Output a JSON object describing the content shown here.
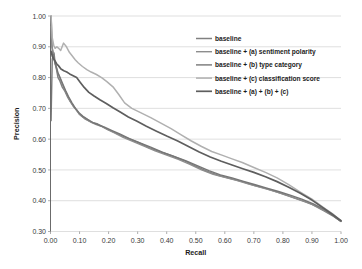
{
  "chart_data": {
    "type": "line",
    "title": "",
    "xlabel": "Recall",
    "ylabel": "Precision",
    "xlim": [
      0.0,
      1.0
    ],
    "ylim": [
      0.3,
      1.0
    ],
    "xticks": [
      "0.00",
      "0.10",
      "0.20",
      "0.30",
      "0.40",
      "0.50",
      "0.60",
      "0.70",
      "0.80",
      "0.90",
      "1.00"
    ],
    "yticks": [
      "0.30",
      "0.40",
      "0.50",
      "0.60",
      "0.70",
      "0.80",
      "0.90",
      "1.00"
    ],
    "grid": "horizontal",
    "legend_position": "upper-right-inside",
    "series": [
      {
        "name": "baseline",
        "color": "#808080",
        "width": 1.5,
        "x": [
          0.002,
          0.005,
          0.008,
          0.012,
          0.016,
          0.02,
          0.026,
          0.032,
          0.04,
          0.05,
          0.06,
          0.07,
          0.08,
          0.09,
          0.1,
          0.12,
          0.14,
          0.16,
          0.18,
          0.2,
          0.23,
          0.26,
          0.3,
          0.34,
          0.38,
          0.42,
          0.46,
          0.5,
          0.54,
          0.58,
          0.62,
          0.66,
          0.7,
          0.74,
          0.78,
          0.82,
          0.86,
          0.9,
          0.94,
          0.97,
          1.0
        ],
        "y": [
          1.0,
          0.905,
          0.87,
          0.88,
          0.845,
          0.83,
          0.8,
          0.79,
          0.77,
          0.755,
          0.735,
          0.72,
          0.705,
          0.695,
          0.68,
          0.665,
          0.655,
          0.65,
          0.64,
          0.63,
          0.618,
          0.605,
          0.59,
          0.572,
          0.558,
          0.545,
          0.53,
          0.512,
          0.495,
          0.482,
          0.472,
          0.462,
          0.45,
          0.44,
          0.428,
          0.415,
          0.402,
          0.388,
          0.368,
          0.352,
          0.333
        ]
      },
      {
        "name": "baseline + (a) sentiment polarity",
        "color": "#8d8d8d",
        "width": 1.4,
        "x": [
          0.002,
          0.005,
          0.009,
          0.013,
          0.018,
          0.023,
          0.03,
          0.038,
          0.048,
          0.058,
          0.068,
          0.08,
          0.092,
          0.104,
          0.118,
          0.135,
          0.155,
          0.175,
          0.195,
          0.22,
          0.25,
          0.285,
          0.32,
          0.36,
          0.4,
          0.44,
          0.48,
          0.52,
          0.56,
          0.6,
          0.64,
          0.68,
          0.72,
          0.76,
          0.8,
          0.84,
          0.88,
          0.92,
          0.96,
          1.0
        ],
        "y": [
          0.965,
          0.9,
          0.885,
          0.855,
          0.84,
          0.82,
          0.805,
          0.785,
          0.762,
          0.742,
          0.722,
          0.706,
          0.69,
          0.678,
          0.668,
          0.658,
          0.648,
          0.642,
          0.632,
          0.62,
          0.606,
          0.592,
          0.578,
          0.562,
          0.548,
          0.534,
          0.518,
          0.5,
          0.486,
          0.476,
          0.466,
          0.455,
          0.444,
          0.434,
          0.422,
          0.409,
          0.396,
          0.38,
          0.36,
          0.333
        ]
      },
      {
        "name": "baseline + (b) type category",
        "color": "#767676",
        "width": 1.4,
        "x": [
          0.002,
          0.006,
          0.01,
          0.015,
          0.02,
          0.026,
          0.034,
          0.042,
          0.052,
          0.062,
          0.074,
          0.086,
          0.098,
          0.112,
          0.128,
          0.146,
          0.166,
          0.188,
          0.212,
          0.24,
          0.272,
          0.308,
          0.345,
          0.385,
          0.425,
          0.465,
          0.505,
          0.545,
          0.585,
          0.625,
          0.665,
          0.705,
          0.745,
          0.785,
          0.825,
          0.865,
          0.905,
          0.945,
          1.0
        ],
        "y": [
          0.66,
          0.86,
          0.875,
          0.85,
          0.835,
          0.815,
          0.798,
          0.78,
          0.758,
          0.738,
          0.718,
          0.7,
          0.686,
          0.674,
          0.664,
          0.654,
          0.646,
          0.638,
          0.628,
          0.616,
          0.602,
          0.588,
          0.574,
          0.558,
          0.544,
          0.53,
          0.514,
          0.498,
          0.484,
          0.474,
          0.463,
          0.452,
          0.441,
          0.43,
          0.418,
          0.405,
          0.39,
          0.37,
          0.333
        ]
      },
      {
        "name": "baseline + (c) classification score",
        "color": "#b0b0b0",
        "width": 1.5,
        "x": [
          0.002,
          0.006,
          0.011,
          0.016,
          0.022,
          0.028,
          0.035,
          0.045,
          0.055,
          0.065,
          0.075,
          0.085,
          0.095,
          0.11,
          0.125,
          0.14,
          0.158,
          0.176,
          0.195,
          0.215,
          0.235,
          0.255,
          0.28,
          0.31,
          0.345,
          0.38,
          0.415,
          0.45,
          0.485,
          0.52,
          0.555,
          0.59,
          0.625,
          0.66,
          0.7,
          0.74,
          0.78,
          0.82,
          0.86,
          0.9,
          0.94,
          0.97,
          1.0
        ],
        "y": [
          1.0,
          0.93,
          0.905,
          0.895,
          0.9,
          0.895,
          0.888,
          0.912,
          0.9,
          0.882,
          0.87,
          0.858,
          0.848,
          0.836,
          0.826,
          0.818,
          0.81,
          0.8,
          0.786,
          0.77,
          0.745,
          0.718,
          0.7,
          0.686,
          0.67,
          0.652,
          0.634,
          0.614,
          0.594,
          0.576,
          0.56,
          0.548,
          0.536,
          0.524,
          0.508,
          0.492,
          0.474,
          0.452,
          0.428,
          0.405,
          0.378,
          0.358,
          0.335
        ]
      },
      {
        "name": "baseline + (a) + (b) + (c)",
        "color": "#5e5e5e",
        "width": 1.7,
        "x": [
          0.002,
          0.006,
          0.01,
          0.015,
          0.021,
          0.028,
          0.036,
          0.046,
          0.056,
          0.066,
          0.078,
          0.09,
          0.102,
          0.116,
          0.132,
          0.15,
          0.17,
          0.192,
          0.215,
          0.24,
          0.268,
          0.298,
          0.33,
          0.365,
          0.4,
          0.438,
          0.475,
          0.512,
          0.55,
          0.588,
          0.625,
          0.662,
          0.7,
          0.74,
          0.78,
          0.82,
          0.86,
          0.9,
          0.94,
          0.97,
          1.0
        ],
        "y": [
          0.885,
          0.87,
          0.862,
          0.855,
          0.845,
          0.838,
          0.828,
          0.822,
          0.818,
          0.812,
          0.806,
          0.8,
          0.785,
          0.768,
          0.752,
          0.74,
          0.728,
          0.716,
          0.702,
          0.688,
          0.672,
          0.658,
          0.642,
          0.626,
          0.61,
          0.594,
          0.576,
          0.558,
          0.542,
          0.528,
          0.516,
          0.504,
          0.492,
          0.478,
          0.462,
          0.444,
          0.424,
          0.402,
          0.376,
          0.356,
          0.335
        ]
      }
    ]
  },
  "legend": {
    "items": [
      {
        "label": "baseline"
      },
      {
        "label": "baseline + (a) sentiment polarity"
      },
      {
        "label": "baseline + (b) type category"
      },
      {
        "label": "baseline + (c) classification score"
      },
      {
        "label": "baseline + (a) + (b) + (c)"
      }
    ]
  }
}
